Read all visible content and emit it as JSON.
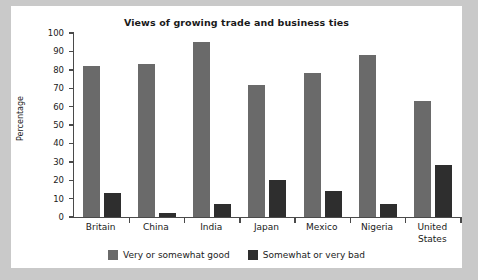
{
  "chart_data": {
    "type": "bar",
    "title": "Views of growing trade and business ties",
    "xlabel": "",
    "ylabel": "Percentage",
    "ylim": [
      0,
      100
    ],
    "ytick_step": 10,
    "yticks": [
      100,
      90,
      80,
      70,
      60,
      50,
      40,
      30,
      20,
      10,
      0
    ],
    "grid": false,
    "legend_position": "bottom",
    "categories": [
      "Britain",
      "China",
      "India",
      "Japan",
      "Mexico",
      "Nigeria",
      "United States"
    ],
    "series": [
      {
        "name": "Very or somewhat good",
        "color": "#6a6a6a",
        "values": [
          82,
          83,
          95,
          72,
          78,
          88,
          63
        ]
      },
      {
        "name": "Somewhat or very bad",
        "color": "#2e2e2e",
        "values": [
          13,
          2,
          7,
          20,
          14,
          7,
          28
        ]
      }
    ]
  },
  "colors": {
    "page_background": "#c9c9c9",
    "panel_background": "#ffffff",
    "axis": "#4a4a4a",
    "text": "#1a1a1a",
    "series_good": "#6a6a6a",
    "series_bad": "#2e2e2e"
  }
}
